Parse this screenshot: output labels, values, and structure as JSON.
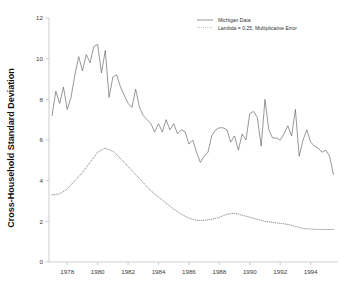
{
  "chart_data": {
    "type": "line",
    "title": "",
    "xlabel": "",
    "ylabel": "Cross-Household Standard Deviation",
    "xlim": [
      1976.8,
      1995.8
    ],
    "ylim": [
      0,
      12
    ],
    "grid": false,
    "legend_position": "top-right",
    "xticks": [
      1978,
      1980,
      1982,
      1984,
      1986,
      1988,
      1990,
      1992,
      1994
    ],
    "xtick_labels": [
      "1978",
      "1980",
      "1982",
      "1984",
      "1986",
      "1988",
      "1990",
      "1992",
      "1994"
    ],
    "yticks": [
      0,
      2,
      4,
      6,
      8,
      10,
      12
    ],
    "ytick_labels": [
      "0",
      "2",
      "4",
      "6",
      "8",
      "10",
      "12"
    ],
    "series": [
      {
        "name": "Michigan Data",
        "style": "solid",
        "color": "#58585c",
        "x": [
          1977.0,
          1977.25,
          1977.5,
          1977.75,
          1978.0,
          1978.25,
          1978.5,
          1978.75,
          1979.0,
          1979.25,
          1979.5,
          1979.75,
          1980.0,
          1980.25,
          1980.5,
          1980.75,
          1981.0,
          1981.25,
          1981.5,
          1981.75,
          1982.0,
          1982.25,
          1982.5,
          1982.75,
          1983.0,
          1983.25,
          1983.5,
          1983.75,
          1984.0,
          1984.25,
          1984.5,
          1984.75,
          1985.0,
          1985.25,
          1985.5,
          1985.75,
          1986.0,
          1986.25,
          1986.5,
          1986.75,
          1987.0,
          1987.25,
          1987.5,
          1987.75,
          1988.0,
          1988.25,
          1988.5,
          1988.75,
          1989.0,
          1989.25,
          1989.5,
          1989.75,
          1990.0,
          1990.25,
          1990.5,
          1990.75,
          1991.0,
          1991.25,
          1991.5,
          1991.75,
          1992.0,
          1992.25,
          1992.5,
          1992.75,
          1993.0,
          1993.25,
          1993.5,
          1993.75,
          1994.0,
          1994.25,
          1994.5,
          1994.75,
          1995.0,
          1995.25,
          1995.5
        ],
        "values": [
          7.2,
          8.4,
          7.8,
          8.6,
          7.5,
          8.1,
          9.2,
          10.1,
          9.4,
          10.2,
          9.8,
          10.6,
          10.7,
          9.3,
          10.4,
          8.1,
          9.1,
          9.2,
          8.6,
          8.2,
          7.8,
          7.6,
          8.5,
          7.6,
          7.2,
          7.0,
          6.8,
          6.4,
          6.8,
          6.4,
          7.0,
          6.5,
          6.8,
          6.3,
          6.5,
          6.4,
          5.8,
          6.0,
          5.4,
          4.9,
          5.2,
          5.4,
          6.2,
          6.5,
          6.6,
          6.6,
          6.5,
          5.9,
          6.2,
          5.5,
          6.3,
          6.0,
          7.3,
          7.4,
          7.1,
          5.7,
          8.0,
          6.5,
          6.1,
          6.1,
          6.0,
          6.3,
          6.7,
          6.2,
          7.5,
          5.2,
          6.0,
          6.5,
          5.9,
          5.7,
          5.6,
          5.4,
          5.5,
          5.2,
          4.3
        ]
      },
      {
        "name": "Lambda = 0.25, Multiplicative Error",
        "style": "dotted",
        "color": "#6d6d72",
        "x": [
          1977.0,
          1977.5,
          1978.0,
          1978.5,
          1979.0,
          1979.5,
          1980.0,
          1980.5,
          1981.0,
          1981.5,
          1982.0,
          1982.5,
          1983.0,
          1983.5,
          1984.0,
          1984.5,
          1985.0,
          1985.5,
          1986.0,
          1986.5,
          1987.0,
          1987.5,
          1988.0,
          1988.5,
          1989.0,
          1989.5,
          1990.0,
          1990.5,
          1991.0,
          1991.5,
          1992.0,
          1992.5,
          1993.0,
          1993.5,
          1994.0,
          1994.5,
          1995.0,
          1995.5
        ],
        "values": [
          3.3,
          3.35,
          3.6,
          4.0,
          4.4,
          4.9,
          5.4,
          5.6,
          5.45,
          5.1,
          4.7,
          4.3,
          3.9,
          3.5,
          3.2,
          2.9,
          2.6,
          2.35,
          2.15,
          2.05,
          2.05,
          2.1,
          2.2,
          2.35,
          2.4,
          2.3,
          2.2,
          2.1,
          2.0,
          1.95,
          1.9,
          1.85,
          1.75,
          1.65,
          1.62,
          1.6,
          1.6,
          1.6
        ]
      }
    ],
    "legend": [
      {
        "label": "Michigan Data",
        "style": "solid"
      },
      {
        "label": "Lambda = 0.25, Multiplicative Error",
        "style": "dotted"
      }
    ]
  }
}
